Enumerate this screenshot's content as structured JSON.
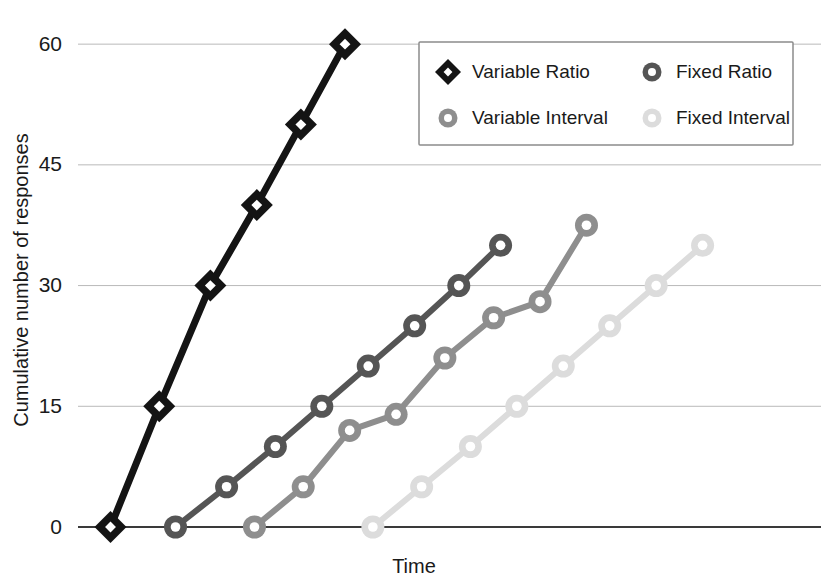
{
  "chart_data": {
    "type": "line",
    "title": "",
    "xlabel": "Time",
    "ylabel": "Cumulative number of responses",
    "ylim": [
      0,
      63
    ],
    "xlim": [
      0,
      16
    ],
    "yticks": [
      0,
      15,
      30,
      45,
      60
    ],
    "ytick_labels": [
      "0",
      "15",
      "30",
      "45",
      "60"
    ],
    "xticks": [],
    "xtick_labels": [],
    "grid": true,
    "legend_position": "upper-right",
    "series": [
      {
        "name": "Variable Ratio",
        "color": "#141414",
        "marker": "diamond",
        "x": [
          0.7,
          1.75,
          2.85,
          3.85,
          4.8,
          5.75
        ],
        "values": [
          0,
          15,
          30,
          40,
          50,
          60
        ]
      },
      {
        "name": "Fixed Ratio",
        "color": "#555555",
        "marker": "circle",
        "x": [
          2.1,
          3.2,
          4.25,
          5.25,
          6.25,
          7.25,
          8.2,
          9.1
        ],
        "values": [
          0,
          5,
          10,
          15,
          20,
          25,
          30,
          35
        ]
      },
      {
        "name": "Variable Interval",
        "color": "#8e8e8e",
        "marker": "circle",
        "x": [
          3.8,
          4.85,
          5.85,
          6.85,
          7.9,
          8.95,
          9.95,
          10.95
        ],
        "values": [
          0,
          5,
          12,
          14,
          21,
          26,
          28,
          37.5
        ]
      },
      {
        "name": "Fixed Interval",
        "color": "#dcdcdc",
        "marker": "circle",
        "x": [
          6.35,
          7.4,
          8.45,
          9.45,
          10.45,
          11.45,
          12.45,
          13.45
        ],
        "values": [
          0,
          5,
          10,
          15,
          20,
          25,
          30,
          35
        ]
      }
    ]
  },
  "legend": {
    "entries": [
      {
        "label": "Variable Ratio",
        "color": "#141414",
        "marker": "diamond"
      },
      {
        "label": "Fixed Ratio",
        "color": "#555555",
        "marker": "circle"
      },
      {
        "label": "Variable Interval",
        "color": "#8e8e8e",
        "marker": "circle"
      },
      {
        "label": "Fixed Interval",
        "color": "#dcdcdc",
        "marker": "circle"
      }
    ]
  },
  "colors": {
    "background": "#ffffff",
    "grid": "#b9b9b9",
    "axis": "#3a3a3a",
    "text": "#1a1a1a",
    "legend_border": "#8c8c8c"
  }
}
